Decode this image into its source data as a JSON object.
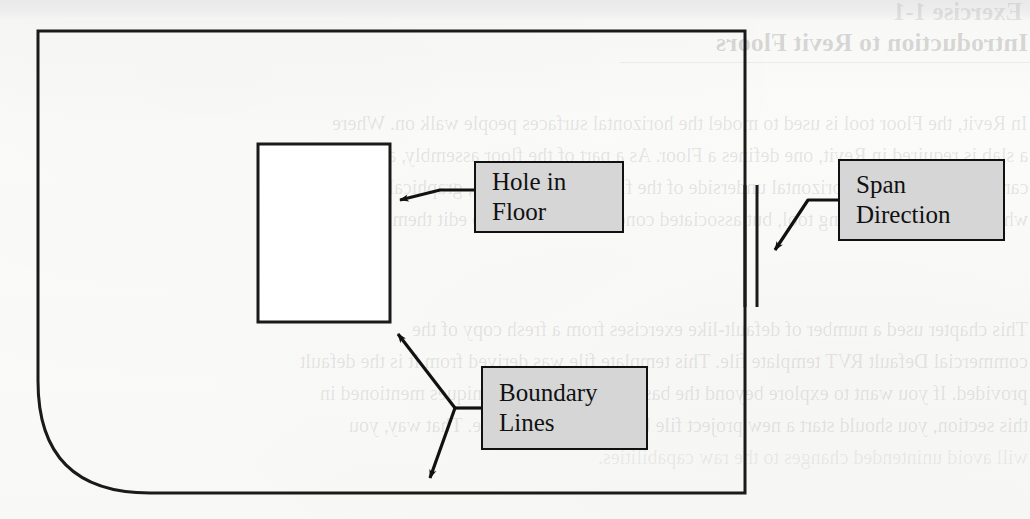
{
  "page": {
    "width": 1030,
    "height": 519,
    "kind": "scanned-textbook-figure",
    "paper_color": "#fbfbfa",
    "ink_color": "#111111"
  },
  "diagram": {
    "floor_outline": {
      "name": "floor-boundary-outline",
      "description": "Closed floor sketch outline: square corners top-left, top-right, bottom-right, with a large rounded fillet at the bottom-left corner",
      "stroke": "#1a1a1a",
      "stroke_width": 3,
      "fill": "none",
      "left": 38,
      "top": 31,
      "right": 745,
      "bottom": 493,
      "corner_radius_bottom_left": 112
    },
    "hole_rectangle": {
      "name": "hole-in-floor-opening",
      "description": "Rectangular opening sketched inside the floor",
      "stroke": "#1a1a1a",
      "stroke_width": 3,
      "fill": "#ffffff",
      "left": 258,
      "top": 144,
      "width": 132,
      "height": 178
    },
    "span_direction_symbol": {
      "name": "span-direction-lines",
      "description": "Two short parallel vertical lines marking the floor span direction",
      "stroke": "#1a1a1a",
      "stroke_width": 3,
      "lines": [
        {
          "x": 745,
          "y1": 185,
          "y2": 307
        },
        {
          "x": 757,
          "y1": 185,
          "y2": 307
        }
      ]
    }
  },
  "callouts": [
    {
      "id": "hole-in-floor",
      "lines": [
        "Hole in",
        "Floor"
      ],
      "box": {
        "x": 474,
        "y": 161,
        "w": 150,
        "h": 72
      },
      "fill": "#d6d6d6",
      "border": "#111111",
      "leader": {
        "description": "Leader from left edge of box, bends left, arrow points left at right edge of hole rectangle",
        "arrow_target": {
          "x": 392,
          "y": 197
        }
      }
    },
    {
      "id": "span-direction",
      "lines": [
        "Span",
        "Direction"
      ],
      "box": {
        "x": 838,
        "y": 159,
        "w": 167,
        "h": 82
      },
      "fill": "#d6d6d6",
      "border": "#111111",
      "leader": {
        "description": "Leader from left edge of box, short horizontal then diagonal down-left, arrow points at the span direction lines",
        "arrow_target": {
          "x": 763,
          "y": 258
        }
      }
    },
    {
      "id": "boundary-lines",
      "lines": [
        "Boundary",
        "Lines"
      ],
      "box": {
        "x": 481,
        "y": 366,
        "w": 167,
        "h": 84
      },
      "fill": "#d6d6d6",
      "border": "#111111",
      "leader": {
        "description": "Leader from left edge of box to a junction, branching into two arrows: one up-left to the hole rectangle bottom-right corner, one down-left to the floor bottom boundary",
        "junction": {
          "x": 455,
          "y": 408
        },
        "arrow_targets": [
          {
            "x": 389,
            "y": 325
          },
          {
            "x": 425,
            "y": 487
          }
        ]
      }
    }
  ],
  "background_showthrough": {
    "description": "Mirrored ink bleed-through from the reverse side of the printed page",
    "exercise_label": "Exercise 1-1",
    "heading": "Introduction to Revit Floors",
    "body_lines": [
      "In Revit, the Floor tool is used to model the horizontal surfaces people walk on.  Where",
      "a slab is required in Revit, one defines a Floor.  As a part of the floor assembly, a ceiling",
      "can be defined on the horizontal underside of the floor.  This will look, graphically, the same as",
      "when one uses the Ceiling tool, but associated conditions, and how to edit them, will vary.",
      "This chapter used a number of default-like exercises from a  fresh copy of the",
      "commercial Default RVT template file.  This template file was derived from it is the default",
      "provided.  If you want to explore beyond the basic concepts and techniques mentioned in",
      "this section, you should start a new project file based on this template.  That way, you",
      "will avoid unintended changes to the raw capabilities."
    ]
  }
}
